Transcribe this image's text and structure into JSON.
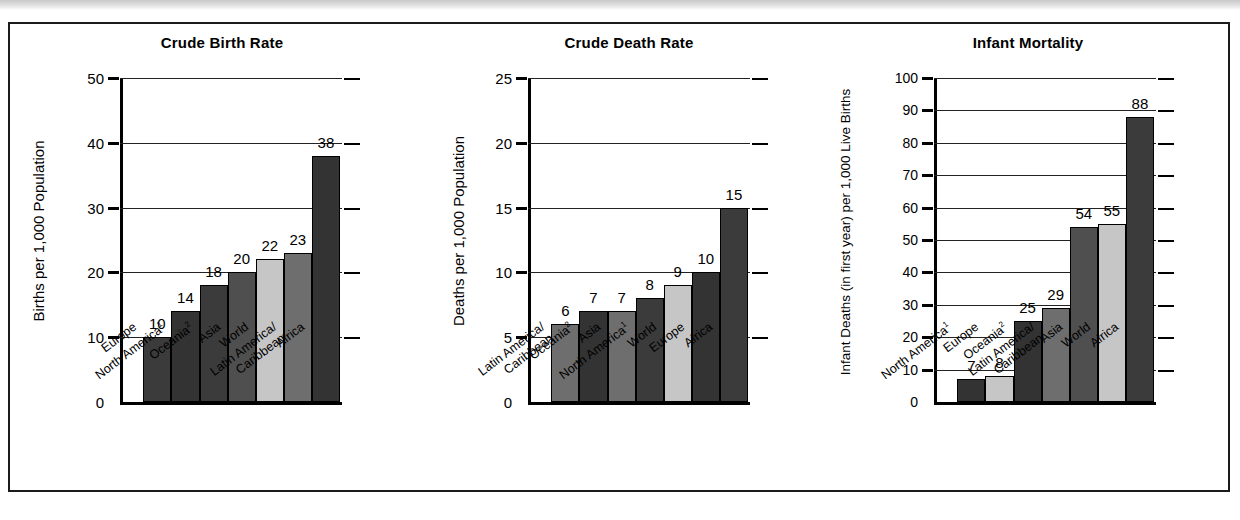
{
  "figure": {
    "background": "#ffffff",
    "frame_color": "#1b1b1b"
  },
  "palette": {
    "dark": "#3b3b3b",
    "dark2": "#333333",
    "medium_dark": "#4f4f4f",
    "medium": "#6e6e6e",
    "light": "#c6c6c6",
    "outline": "#000000"
  },
  "chart_data": [
    {
      "type": "bar",
      "title": "Crude Birth Rate",
      "xlabel": "",
      "ylabel": "Births per 1,000 Population",
      "ylim": [
        0,
        50
      ],
      "yticks": [
        0,
        10,
        20,
        30,
        40,
        50
      ],
      "ytick_labels": [
        "0",
        "10",
        "20",
        "30",
        "40",
        "50"
      ],
      "grid": true,
      "categories": [
        "Europe",
        "North America",
        "Oceania",
        "Asia",
        "World",
        "Latin America/Caribbean",
        "Africa"
      ],
      "category_lines": [
        [
          "Europe"
        ],
        [
          "North America"
        ],
        [
          "Oceania"
        ],
        [
          "Asia"
        ],
        [
          "World"
        ],
        [
          "Latin America/",
          "Caribbean"
        ],
        [
          "Africa"
        ]
      ],
      "category_footnotes": [
        "",
        "1",
        "2",
        "",
        "",
        "",
        ""
      ],
      "values": [
        10,
        14,
        18,
        20,
        22,
        23,
        38
      ],
      "value_labels": [
        "10",
        "14",
        "18",
        "20",
        "22",
        "23",
        "38"
      ],
      "bar_shades": [
        "dark",
        "dark2",
        "dark",
        "medium_dark",
        "light",
        "medium",
        "dark2"
      ]
    },
    {
      "type": "bar",
      "title": "Crude Death Rate",
      "xlabel": "",
      "ylabel": "Deaths per 1,000 Population",
      "ylim": [
        0,
        25
      ],
      "yticks": [
        0,
        5,
        10,
        15,
        20,
        25
      ],
      "ytick_labels": [
        "0",
        "5",
        "10",
        "15",
        "20",
        "25"
      ],
      "grid": true,
      "categories": [
        "Latin America/Caribbean",
        "Oceania",
        "Asia",
        "North America",
        "World",
        "Europe",
        "Africa"
      ],
      "category_lines": [
        [
          "Latin America/",
          "Caribbean"
        ],
        [
          "Oceania"
        ],
        [
          "Asia"
        ],
        [
          "North America"
        ],
        [
          "World"
        ],
        [
          "Europe"
        ],
        [
          "Africa"
        ]
      ],
      "category_footnotes": [
        "",
        "2",
        "",
        "1",
        "",
        "",
        ""
      ],
      "values": [
        6,
        7,
        7,
        8,
        9,
        10,
        15
      ],
      "value_labels": [
        "6",
        "7",
        "7",
        "8",
        "9",
        "10",
        "15"
      ],
      "bar_shades": [
        "medium",
        "dark2",
        "medium",
        "dark",
        "light",
        "dark2",
        "dark"
      ]
    },
    {
      "type": "bar",
      "title": "Infant Mortality",
      "xlabel": "",
      "ylabel": "Infant Deaths (in first year) per 1,000 Live Births",
      "ylim": [
        0,
        100
      ],
      "yticks": [
        0,
        10,
        20,
        30,
        40,
        50,
        60,
        70,
        80,
        90,
        100
      ],
      "ytick_labels": [
        "0",
        "10",
        "20",
        "30",
        "40",
        "50",
        "60",
        "70",
        "80",
        "90",
        "100"
      ],
      "grid": true,
      "categories": [
        "North America",
        "Europe",
        "Oceania",
        "Latin America/Caribbean",
        "Asia",
        "World",
        "Africa"
      ],
      "category_lines": [
        [
          "North America"
        ],
        [
          "Europe"
        ],
        [
          "Oceania"
        ],
        [
          "Latin America/",
          "Caribbean"
        ],
        [
          "Asia"
        ],
        [
          "World"
        ],
        [
          "Africa"
        ]
      ],
      "category_footnotes": [
        "1",
        "",
        "2",
        "",
        "",
        "",
        ""
      ],
      "values": [
        7,
        8,
        25,
        29,
        54,
        55,
        88
      ],
      "value_labels": [
        "7",
        "8",
        "25",
        "29",
        "54",
        "55",
        "88"
      ],
      "bar_shades": [
        "dark2",
        "light",
        "dark2",
        "medium",
        "medium_dark",
        "light",
        "dark"
      ]
    }
  ]
}
